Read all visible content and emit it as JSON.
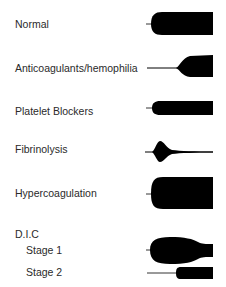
{
  "rows": [
    {
      "id": "normal",
      "label": "Normal"
    },
    {
      "id": "anticoagulants",
      "label": "Anticoagulants/hemophilia"
    },
    {
      "id": "platelet-blockers",
      "label": "Platelet Blockers"
    },
    {
      "id": "fibrinolysis",
      "label": "Fibrinolysis"
    },
    {
      "id": "hypercoagulation",
      "label": "Hypercoagulation"
    },
    {
      "id": "dic",
      "label": "D.I.C"
    },
    {
      "id": "dic-stage-1",
      "label": "Stage 1"
    },
    {
      "id": "dic-stage-2",
      "label": "Stage 2"
    }
  ],
  "colors": {
    "trace": "#000000",
    "text": "#2a2a2a",
    "background": "#ffffff"
  }
}
